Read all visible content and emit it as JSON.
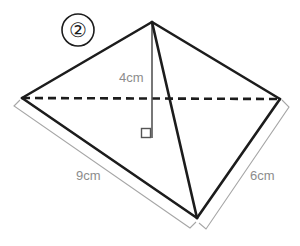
{
  "figure": {
    "kind": "geometry-diagram",
    "item_number": "②",
    "colors": {
      "background": "#ffffff",
      "solid_edge": "#1c1c1c",
      "hidden_edge": "#1c1c1c",
      "dimension_line": "#a6a6a6",
      "dimension_text": "#8c8c8c",
      "height_line": "#555555"
    },
    "labels": {
      "height": "4cm",
      "base": "9cm",
      "slant": "6cm"
    },
    "vertices": {
      "apex": [
        152,
        22
      ],
      "left": [
        22,
        98
      ],
      "right": [
        280,
        99
      ],
      "front": [
        197,
        218
      ],
      "foot_of_height": [
        152,
        138
      ]
    },
    "edges": [
      {
        "name": "apex-to-left",
        "from": [
          152,
          22
        ],
        "to": [
          22,
          98
        ],
        "style": "solid"
      },
      {
        "name": "apex-to-right",
        "from": [
          152,
          22
        ],
        "to": [
          280,
          99
        ],
        "style": "solid"
      },
      {
        "name": "apex-to-front",
        "from": [
          152,
          22
        ],
        "to": [
          197,
          218
        ],
        "style": "solid"
      },
      {
        "name": "left-to-front",
        "from": [
          22,
          98
        ],
        "to": [
          197,
          218
        ],
        "style": "solid"
      },
      {
        "name": "right-to-front",
        "from": [
          280,
          99
        ],
        "to": [
          197,
          218
        ],
        "style": "solid"
      },
      {
        "name": "left-to-right-hidden",
        "from": [
          22,
          98
        ],
        "to": [
          280,
          99
        ],
        "style": "dashed"
      },
      {
        "name": "apex-to-foot-height",
        "from": [
          152,
          22
        ],
        "to": [
          152,
          138
        ],
        "style": "solid-thin"
      }
    ],
    "right_angle_marker": {
      "x": 141,
      "y": 128,
      "size": 10
    },
    "dimension_brackets": [
      {
        "name": "base-bracket-9cm",
        "from": [
          14,
          105
        ],
        "to": [
          190,
          227
        ],
        "label": "9cm"
      },
      {
        "name": "slant-bracket-6cm",
        "from": [
          288,
          106
        ],
        "to": [
          205,
          228
        ],
        "label": "6cm"
      }
    ]
  }
}
